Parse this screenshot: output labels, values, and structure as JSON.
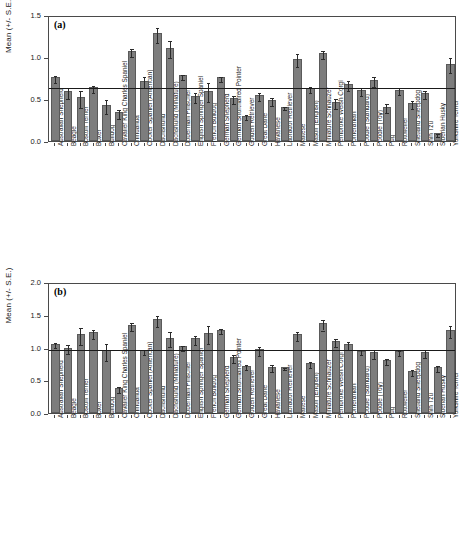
{
  "figure": {
    "background": "#ffffff",
    "bar_color": "#7d7d7d",
    "bar_edge_color": "#5a5a5a",
    "axis_color": "#4a4a4a",
    "error_bar_color": "#2b2b2b",
    "reference_line_color": "#1a1a1a"
  },
  "chart_data": [
    {
      "type": "bar",
      "panel": "a",
      "panel_label": "(a)",
      "title": "",
      "xlabel": "",
      "ylabel": "Mean (+/- S.E.)",
      "ylim": [
        0.0,
        1.5
      ],
      "yticks": [
        0.0,
        0.5,
        1.0,
        1.5
      ],
      "ytick_labels": [
        "0.0",
        "0.5",
        "1.0",
        "1.5"
      ],
      "grid": false,
      "legend": "none",
      "reference_line": 0.65,
      "categories": [
        "Australian Shepherd",
        "Beagle",
        "Boston Terrier",
        "Boxer",
        "Bulldog",
        "Cavalier King Charles Spaniel",
        "Chihuahua",
        "Cocker Spaniel (American)",
        "Dachshund",
        "Dachshund (Miniature)",
        "Doberman Pinscher",
        "English Springer Spaniel",
        "French Bulldog",
        "German Shepherd",
        "German Shorthaired Pointer",
        "Golden Retriever",
        "Great Dane",
        "Havanese",
        "Labrador Retriever",
        "Maltese",
        "Mastiff (English)",
        "Miniature Schnauzer",
        "Pembroke Welsh Corgi",
        "Pomeranian",
        "Poodle (Standard)",
        "Poodle (Toy)",
        "Pug",
        "Rottweiler",
        "Shetland Sheepdog",
        "Shih Tzu",
        "Siberian Husky",
        "Yorkshire Terrier"
      ],
      "values": [
        0.76,
        0.59,
        0.52,
        0.64,
        0.43,
        0.34,
        1.07,
        0.72,
        1.28,
        1.11,
        0.78,
        0.54,
        0.6,
        0.76,
        0.51,
        0.3,
        0.55,
        0.49,
        0.41,
        0.98,
        0.63,
        1.05,
        0.46,
        0.68,
        0.61,
        0.73,
        0.41,
        0.61,
        0.45,
        0.57,
        0.09,
        0.92
      ],
      "errors": [
        0.04,
        0.07,
        0.1,
        0.04,
        0.08,
        0.05,
        0.05,
        0.06,
        0.09,
        0.1,
        0.03,
        0.06,
        0.11,
        0.03,
        0.05,
        0.03,
        0.05,
        0.05,
        0.02,
        0.08,
        0.04,
        0.05,
        0.06,
        0.06,
        0.05,
        0.06,
        0.05,
        0.04,
        0.05,
        0.05,
        0.02,
        0.09
      ]
    },
    {
      "type": "bar",
      "panel": "b",
      "panel_label": "(b)",
      "title": "",
      "xlabel": "",
      "ylabel": "Mean (+/- S.E.)",
      "ylim": [
        0.0,
        2.0
      ],
      "yticks": [
        0.0,
        0.5,
        1.0,
        1.5,
        2.0
      ],
      "ytick_labels": [
        "0.0",
        "0.5",
        "1.0",
        "1.5",
        "2.0"
      ],
      "grid": false,
      "legend": "none",
      "reference_line": 1.0,
      "categories": [
        "Australian Shepherd",
        "Beagle",
        "Boston Terrier",
        "Boxer",
        "Bulldog",
        "Cavalier King Charles Spaniel",
        "Chihuahua",
        "Cocker Spaniel (American)",
        "Dachshund",
        "Dachshund (Miniature)",
        "Doberman Pinscher",
        "English Springer Spaniel",
        "French Bulldog",
        "German Shepherd",
        "German Shorthaired Pointer",
        "Golden Retriever",
        "Great Dane",
        "Havanese",
        "Labrador Retriever",
        "Maltese",
        "Mastiff (English)",
        "Miniature Schnauzer",
        "Pembroke Welsh Corgi",
        "Pomeranian",
        "Poodle (Standard)",
        "Poodle (Toy)",
        "Pug",
        "Rottweiler",
        "Shetland Sheepdog",
        "Shih Tzu",
        "Siberian Husky",
        "Yorkshire Terrier"
      ],
      "values": [
        1.06,
        1.0,
        1.2,
        1.23,
        0.96,
        0.38,
        1.35,
        0.96,
        1.43,
        1.15,
        1.02,
        1.14,
        1.22,
        1.27,
        0.86,
        0.72,
        0.97,
        0.71,
        0.7,
        1.2,
        0.76,
        1.37,
        1.1,
        1.05,
        0.95,
        0.93,
        0.81,
        0.94,
        0.64,
        0.93,
        0.7,
        1.27
      ],
      "errors": [
        0.04,
        0.07,
        0.13,
        0.07,
        0.13,
        0.05,
        0.06,
        0.04,
        0.08,
        0.11,
        0.04,
        0.07,
        0.14,
        0.04,
        0.06,
        0.04,
        0.07,
        0.05,
        0.02,
        0.07,
        0.05,
        0.08,
        0.06,
        0.06,
        0.04,
        0.07,
        0.05,
        0.04,
        0.05,
        0.06,
        0.05,
        0.09
      ]
    }
  ]
}
